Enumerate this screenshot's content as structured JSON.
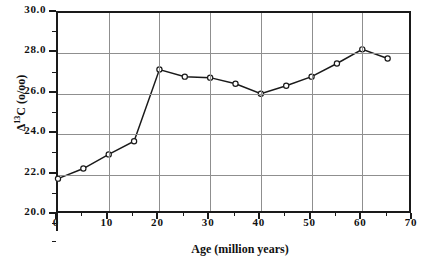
{
  "chart_data": {
    "type": "line",
    "title": "",
    "xlabel": "Age (million years)",
    "ylabel_text": "Δ",
    "ylabel_sup": "13",
    "ylabel_rest": "C  (o/oo)",
    "ylabel_full": "Δ13C (o/oo)",
    "xlim": [
      0,
      70
    ],
    "ylim": [
      20.0,
      30.0
    ],
    "grid": true,
    "legend": "none",
    "marker": "open-circle",
    "line_color": "#1a1a1a",
    "grid_color": "#8f8f8f",
    "axis_color": "#1a1a1a",
    "x_ticks": [
      0,
      10,
      20,
      30,
      40,
      50,
      60,
      70
    ],
    "x_tick_labels": [
      "0",
      "10",
      "20",
      "30",
      "40",
      "50",
      "60",
      "70"
    ],
    "x_minor_ticks": [
      5,
      15,
      25,
      35,
      45,
      55,
      65
    ],
    "y_ticks": [
      20.0,
      22.0,
      24.0,
      26.0,
      28.0,
      30.0
    ],
    "y_tick_labels": [
      "20.0",
      "22.0",
      "24.0",
      "26.0",
      "28.0",
      "30.0"
    ],
    "y_minor_ticks": [
      21.0,
      23.0,
      25.0,
      27.0,
      29.0
    ],
    "x": [
      0,
      5,
      10,
      15,
      20,
      25,
      30,
      35,
      40,
      45,
      50,
      55,
      60,
      65
    ],
    "values": [
      21.8,
      22.3,
      23.0,
      23.65,
      27.2,
      26.85,
      26.8,
      26.5,
      26.0,
      26.4,
      26.85,
      27.5,
      28.2,
      27.75
    ],
    "series": [
      {
        "name": "Delta 13C",
        "values": [
          21.8,
          22.3,
          23.0,
          23.65,
          27.2,
          26.85,
          26.8,
          26.5,
          26.0,
          26.4,
          26.85,
          27.5,
          28.2,
          27.75
        ]
      }
    ]
  }
}
